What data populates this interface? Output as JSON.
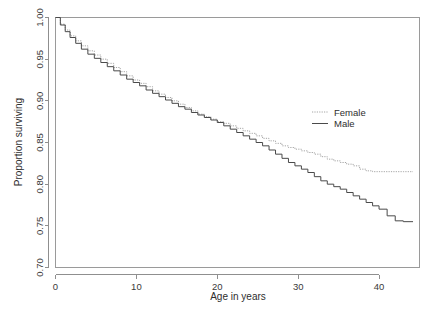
{
  "chart_data": {
    "type": "line",
    "title": "",
    "xlabel": "Age in years",
    "ylabel": "Proportion surviving",
    "xlim": [
      0,
      45
    ],
    "ylim": [
      0.7,
      1.0
    ],
    "grid": false,
    "legend_position": "right-center",
    "xticks": [
      0,
      10,
      20,
      30,
      40
    ],
    "xtick_labels": [
      "0",
      "10",
      "20",
      "30",
      "40"
    ],
    "yticks": [
      0.7,
      0.75,
      0.8,
      0.85,
      0.9,
      0.95,
      1.0
    ],
    "ytick_labels": [
      "0.70",
      "0.75",
      "0.80",
      "0.85",
      "0.90",
      "0.95",
      "1.00"
    ],
    "series": [
      {
        "name": "Female",
        "linestyle": "dotted",
        "color": "#9b9b9b",
        "x": [
          0,
          0.6,
          1.2,
          1.8,
          2.5,
          3.2,
          4.0,
          4.8,
          5.6,
          6.4,
          7.2,
          8.0,
          8.8,
          9.6,
          10.4,
          11.2,
          12.0,
          12.8,
          13.6,
          14.4,
          15.2,
          16.0,
          16.8,
          17.6,
          18.4,
          19.2,
          20.0,
          20.8,
          21.6,
          22.4,
          23.2,
          24.0,
          24.8,
          25.6,
          26.4,
          27.2,
          28.0,
          28.8,
          29.6,
          30.4,
          31.2,
          32.0,
          32.8,
          33.6,
          34.4,
          35.2,
          36.0,
          36.8,
          37.6,
          38.4,
          39.2,
          40.0,
          41.0,
          42.0,
          43.0,
          44.2
        ],
        "values": [
          1.0,
          0.992,
          0.985,
          0.978,
          0.972,
          0.966,
          0.96,
          0.955,
          0.95,
          0.945,
          0.94,
          0.935,
          0.93,
          0.925,
          0.921,
          0.917,
          0.912,
          0.908,
          0.904,
          0.9,
          0.896,
          0.892,
          0.888,
          0.884,
          0.881,
          0.878,
          0.875,
          0.873,
          0.87,
          0.867,
          0.864,
          0.861,
          0.858,
          0.855,
          0.852,
          0.849,
          0.846,
          0.844,
          0.842,
          0.84,
          0.838,
          0.836,
          0.833,
          0.83,
          0.828,
          0.826,
          0.824,
          0.822,
          0.818,
          0.816,
          0.815,
          0.815,
          0.815,
          0.815,
          0.815,
          0.815
        ]
      },
      {
        "name": "Male",
        "linestyle": "solid",
        "color": "#4a4a4a",
        "x": [
          0,
          0.6,
          1.2,
          1.8,
          2.5,
          3.2,
          4.0,
          4.8,
          5.6,
          6.4,
          7.2,
          8.0,
          8.8,
          9.6,
          10.4,
          11.2,
          12.0,
          12.8,
          13.6,
          14.4,
          15.2,
          16.0,
          16.8,
          17.6,
          18.4,
          19.2,
          20.0,
          20.8,
          21.6,
          22.4,
          23.2,
          24.0,
          24.8,
          25.6,
          26.4,
          27.2,
          28.0,
          28.8,
          29.6,
          30.4,
          31.2,
          32.0,
          32.8,
          33.6,
          34.4,
          35.2,
          36.0,
          36.8,
          37.6,
          38.4,
          39.2,
          40.0,
          41.0,
          42.0,
          43.0,
          44.2
        ],
        "values": [
          1.0,
          0.991,
          0.983,
          0.976,
          0.969,
          0.962,
          0.956,
          0.951,
          0.946,
          0.941,
          0.936,
          0.931,
          0.926,
          0.922,
          0.918,
          0.913,
          0.909,
          0.905,
          0.901,
          0.897,
          0.893,
          0.89,
          0.886,
          0.883,
          0.88,
          0.877,
          0.874,
          0.87,
          0.866,
          0.862,
          0.858,
          0.854,
          0.85,
          0.846,
          0.841,
          0.836,
          0.831,
          0.826,
          0.822,
          0.818,
          0.814,
          0.809,
          0.804,
          0.8,
          0.797,
          0.794,
          0.79,
          0.786,
          0.782,
          0.778,
          0.774,
          0.77,
          0.762,
          0.756,
          0.755,
          0.755
        ]
      }
    ],
    "legend": [
      {
        "label": "Female",
        "linestyle": "dotted",
        "color": "#9b9b9b"
      },
      {
        "label": "Male",
        "linestyle": "solid",
        "color": "#4a4a4a"
      }
    ]
  }
}
